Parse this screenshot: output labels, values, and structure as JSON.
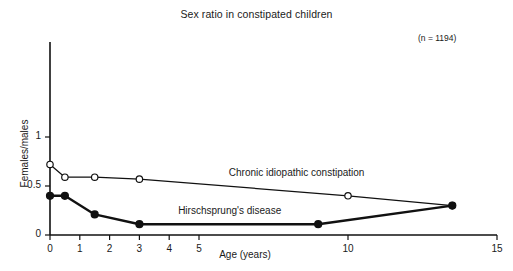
{
  "chart_data": {
    "type": "line",
    "title": "Sex ratio in constipated children",
    "xlabel": "Age (years)",
    "ylabel": "Females/males",
    "annotation": "(n = 1194)",
    "xlim": [
      0,
      15
    ],
    "ylim": [
      0,
      1.15
    ],
    "xticks": [
      0,
      1,
      2,
      3,
      4,
      5,
      10,
      15
    ],
    "xticklabels": [
      "0",
      "1",
      "2",
      "3",
      "4",
      "5",
      "10",
      "15"
    ],
    "yticks": [
      0,
      0.5,
      1
    ],
    "yticklabels": [
      "0",
      "0.5",
      "1"
    ],
    "grid": false,
    "legend_position": "inline-annotations",
    "series": [
      {
        "name": "Chronic idiopathic constipation",
        "marker": "open-circle",
        "label_x": 6.0,
        "label_y": 0.62,
        "points": [
          {
            "x": 0.0,
            "y": 0.72
          },
          {
            "x": 0.5,
            "y": 0.59
          },
          {
            "x": 1.5,
            "y": 0.59
          },
          {
            "x": 3.0,
            "y": 0.57
          },
          {
            "x": 10.0,
            "y": 0.4
          },
          {
            "x": 13.5,
            "y": 0.3
          }
        ]
      },
      {
        "name": "Hirschsprung's disease",
        "marker": "filled-circle",
        "label_x": 4.3,
        "label_y": 0.23,
        "points": [
          {
            "x": 0.0,
            "y": 0.4
          },
          {
            "x": 0.5,
            "y": 0.4
          },
          {
            "x": 1.5,
            "y": 0.21
          },
          {
            "x": 3.0,
            "y": 0.11
          },
          {
            "x": 9.0,
            "y": 0.11
          },
          {
            "x": 13.5,
            "y": 0.3
          }
        ]
      }
    ],
    "colors": {
      "axis": "#111111",
      "line": "#111111",
      "marker_fill_open": "#ffffff",
      "marker_fill_closed": "#111111",
      "background": "#ffffff"
    }
  }
}
